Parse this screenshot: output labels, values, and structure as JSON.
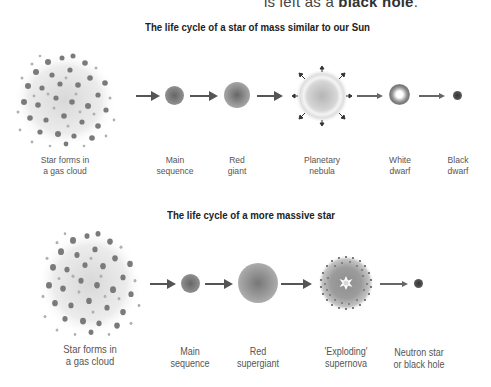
{
  "header_fragment": {
    "prefix": "is left as a ",
    "emphasis": "black hole",
    "suffix": "."
  },
  "sections": [
    {
      "title": "The life cycle of a star of mass similar to our Sun",
      "stages": [
        {
          "line1": "Star forms in",
          "line2": "a gas cloud",
          "icon": "gas-cloud-icon"
        },
        {
          "line1": "Main",
          "line2": "sequence",
          "icon": "main-sequence-star-icon"
        },
        {
          "line1": "Red",
          "line2": "giant",
          "icon": "red-giant-icon"
        },
        {
          "line1": "Planetary",
          "line2": "nebula",
          "icon": "planetary-nebula-icon"
        },
        {
          "line1": "White",
          "line2": "dwarf",
          "icon": "white-dwarf-icon"
        },
        {
          "line1": "Black",
          "line2": "dwarf",
          "icon": "black-dwarf-icon"
        }
      ]
    },
    {
      "title": "The life cycle of a more massive star",
      "stages": [
        {
          "line1": "Star forms in",
          "line2": "a gas cloud",
          "icon": "gas-cloud-icon"
        },
        {
          "line1": "Main",
          "line2": "sequence",
          "icon": "main-sequence-star-icon"
        },
        {
          "line1": "Red",
          "line2": "supergiant",
          "icon": "red-supergiant-icon"
        },
        {
          "line1": "'Exploding'",
          "line2": "supernova",
          "icon": "supernova-icon"
        },
        {
          "line1": "Neutron star",
          "line2": "or black hole",
          "icon": "neutron-star-icon"
        }
      ]
    }
  ],
  "colors": {
    "star_fill": "#8a8a8a",
    "star_dark": "#555555",
    "text": "#555555",
    "title": "#222222",
    "arrow": "#555555"
  }
}
